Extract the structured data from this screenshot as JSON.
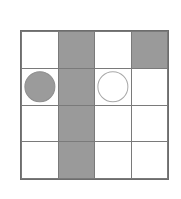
{
  "figure": {
    "name": "four-by-four-grid-with-tokens",
    "background_color": "#ffffff",
    "border_color": "#6d6d6d",
    "gridline_color": "#7a7a7a",
    "shaded_cell_color": "#9a9a9a",
    "rows": 4,
    "columns": 4,
    "cells": [
      [
        {
          "fill": "white",
          "token": "none"
        },
        {
          "fill": "shaded",
          "token": "none"
        },
        {
          "fill": "white",
          "token": "none"
        },
        {
          "fill": "shaded",
          "token": "none"
        }
      ],
      [
        {
          "fill": "white",
          "token": "gray-disc"
        },
        {
          "fill": "shaded",
          "token": "none"
        },
        {
          "fill": "white",
          "token": "white-disc"
        },
        {
          "fill": "white",
          "token": "none"
        }
      ],
      [
        {
          "fill": "white",
          "token": "none"
        },
        {
          "fill": "shaded",
          "token": "none"
        },
        {
          "fill": "white",
          "token": "none"
        },
        {
          "fill": "white",
          "token": "none"
        }
      ],
      [
        {
          "fill": "white",
          "token": "none"
        },
        {
          "fill": "shaded",
          "token": "none"
        },
        {
          "fill": "white",
          "token": "none"
        },
        {
          "fill": "white",
          "token": "none"
        }
      ]
    ]
  }
}
